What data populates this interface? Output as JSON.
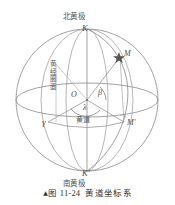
{
  "figure": {
    "caption_marker": "▲",
    "caption_label": "图 11-24",
    "caption_title": "黄道坐标系",
    "background_color": "#ffffff",
    "line_color": "#8a8a8a",
    "text_color": "#4a4a4a"
  },
  "labels": {
    "north_ecliptic_pole_cn": "北黄极",
    "north_ecliptic_pole_symbol": "K",
    "south_ecliptic_pole_cn": "南黄极",
    "south_ecliptic_pole_symbol": "K'",
    "star_point": "M",
    "star_projection": "M'",
    "vernal_equinox": "γ",
    "origin": "O",
    "ecliptic_latitude": "β",
    "ecliptic_longitude": "λ",
    "ecliptic_plane_cn": "黄道",
    "longitude_circle_cn": [
      "黄",
      "经",
      "圈",
      "面"
    ]
  },
  "diagram": {
    "type": "celestial-sphere",
    "sphere": {
      "cx": 87,
      "cy": 100,
      "r": 72
    },
    "ecliptic_ellipse": {
      "cx": 87,
      "cy": 100,
      "rx": 72,
      "ry": 17
    },
    "front_arc_ellipse": {
      "cx": 87,
      "cy": 100,
      "rx": 46,
      "ry": 72
    },
    "meridian_ellipses": [
      {
        "rx": 46,
        "ry": 72
      },
      {
        "rx": 22,
        "ry": 72
      }
    ],
    "points": {
      "K": {
        "x": 87,
        "y": 28
      },
      "K_prime": {
        "x": 87,
        "y": 172
      },
      "O": {
        "x": 87,
        "y": 100
      },
      "M": {
        "x": 120,
        "y": 57
      },
      "M_prime": {
        "x": 124,
        "y": 123
      },
      "gamma": {
        "x": 48,
        "y": 123
      }
    }
  }
}
